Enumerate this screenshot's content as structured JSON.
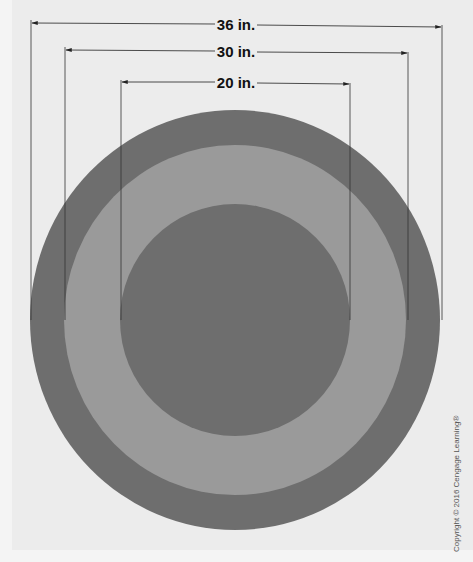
{
  "figure": {
    "labels": {
      "outer": "36 in.",
      "middle": "30 in.",
      "inner": "20 in."
    },
    "colors": {
      "background": "#ececec",
      "dark_ring": "#6e6e6e",
      "light_ring": "#9a9a9a",
      "line": "#222222"
    },
    "copyright": "Copyright © 2016 Cengage Learning®"
  }
}
